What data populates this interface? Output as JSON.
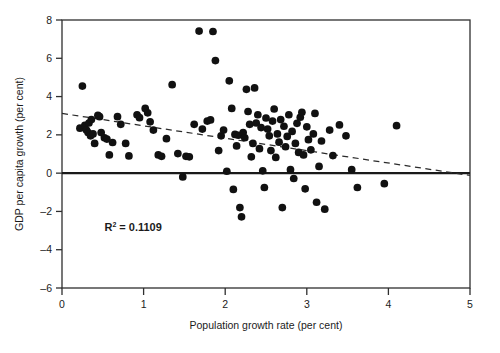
{
  "chart_data": {
    "type": "scatter",
    "title": "",
    "xlabel": "Population growth rate (per cent)",
    "ylabel": "GDP per capita growth (per cent)",
    "xlim": [
      0,
      5
    ],
    "ylim": [
      -6,
      8
    ],
    "xticks": [
      0,
      1,
      2,
      3,
      4,
      5
    ],
    "xtick_labels": [
      "0",
      "1",
      "2",
      "3",
      "4",
      "5"
    ],
    "yticks": [
      -6,
      -4,
      -2,
      0,
      2,
      4,
      6,
      8
    ],
    "ytick_labels": [
      "-6",
      "-4",
      "-2",
      "0",
      "2",
      "4",
      "6",
      "8"
    ],
    "grid": false,
    "legend": null,
    "marker_color": "#111111",
    "marker_size": 5.2,
    "zero_line": {
      "y": 0,
      "color": "#1a1a1a",
      "width": 2.2
    },
    "trendline": {
      "style": "dashed",
      "color": "#2b2b2b",
      "x_start": 0.0,
      "y_start": 3.12,
      "x_end": 5.0,
      "y_end": -0.12
    },
    "annotations": [
      {
        "name": "r-squared",
        "text_prefix": "R",
        "text_sup": "2",
        "text_rest": " = 0.1109",
        "x": 0.52,
        "y": -3.0
      }
    ],
    "points": [
      [
        0.22,
        2.35
      ],
      [
        0.25,
        4.55
      ],
      [
        0.28,
        2.5
      ],
      [
        0.3,
        2.25
      ],
      [
        0.32,
        2.12
      ],
      [
        0.33,
        2.62
      ],
      [
        0.35,
        1.95
      ],
      [
        0.36,
        2.8
      ],
      [
        0.38,
        2.05
      ],
      [
        0.4,
        1.55
      ],
      [
        0.44,
        3.02
      ],
      [
        0.46,
        2.95
      ],
      [
        0.48,
        2.12
      ],
      [
        0.52,
        1.85
      ],
      [
        0.55,
        1.78
      ],
      [
        0.58,
        0.95
      ],
      [
        0.62,
        1.6
      ],
      [
        0.68,
        2.95
      ],
      [
        0.72,
        2.55
      ],
      [
        0.78,
        1.55
      ],
      [
        0.82,
        0.9
      ],
      [
        0.92,
        3.05
      ],
      [
        0.95,
        2.9
      ],
      [
        1.02,
        3.38
      ],
      [
        1.05,
        3.15
      ],
      [
        1.08,
        2.68
      ],
      [
        1.12,
        2.25
      ],
      [
        1.18,
        0.95
      ],
      [
        1.22,
        0.88
      ],
      [
        1.28,
        1.8
      ],
      [
        1.35,
        4.62
      ],
      [
        1.42,
        1.02
      ],
      [
        1.48,
        -0.2
      ],
      [
        1.52,
        0.88
      ],
      [
        1.56,
        0.85
      ],
      [
        1.62,
        2.55
      ],
      [
        1.68,
        7.42
      ],
      [
        1.72,
        2.3
      ],
      [
        1.78,
        2.72
      ],
      [
        1.82,
        2.78
      ],
      [
        1.85,
        7.4
      ],
      [
        1.88,
        5.88
      ],
      [
        1.92,
        1.18
      ],
      [
        1.95,
        1.95
      ],
      [
        1.98,
        2.25
      ],
      [
        2.02,
        0.1
      ],
      [
        2.05,
        4.82
      ],
      [
        2.08,
        3.38
      ],
      [
        2.1,
        -0.85
      ],
      [
        2.12,
        2.02
      ],
      [
        2.14,
        1.42
      ],
      [
        2.16,
        1.98
      ],
      [
        2.18,
        -1.8
      ],
      [
        2.2,
        -2.28
      ],
      [
        2.22,
        2.12
      ],
      [
        2.24,
        1.85
      ],
      [
        2.26,
        4.38
      ],
      [
        2.28,
        3.22
      ],
      [
        2.3,
        2.55
      ],
      [
        2.32,
        0.85
      ],
      [
        2.34,
        1.55
      ],
      [
        2.36,
        4.45
      ],
      [
        2.38,
        2.62
      ],
      [
        2.4,
        3.05
      ],
      [
        2.42,
        1.28
      ],
      [
        2.44,
        2.38
      ],
      [
        2.46,
        0.12
      ],
      [
        2.48,
        -0.75
      ],
      [
        2.5,
        2.88
      ],
      [
        2.52,
        2.3
      ],
      [
        2.54,
        1.95
      ],
      [
        2.56,
        1.18
      ],
      [
        2.58,
        2.72
      ],
      [
        2.6,
        3.35
      ],
      [
        2.62,
        0.82
      ],
      [
        2.64,
        2.05
      ],
      [
        2.66,
        1.62
      ],
      [
        2.68,
        2.8
      ],
      [
        2.7,
        -1.8
      ],
      [
        2.72,
        2.45
      ],
      [
        2.74,
        1.38
      ],
      [
        2.76,
        1.92
      ],
      [
        2.78,
        3.05
      ],
      [
        2.8,
        0.18
      ],
      [
        2.82,
        2.18
      ],
      [
        2.84,
        -0.28
      ],
      [
        2.86,
        1.55
      ],
      [
        2.88,
        2.6
      ],
      [
        2.9,
        1.08
      ],
      [
        2.92,
        2.92
      ],
      [
        2.94,
        3.18
      ],
      [
        2.96,
        0.95
      ],
      [
        2.98,
        -0.82
      ],
      [
        3.0,
        2.42
      ],
      [
        3.02,
        1.75
      ],
      [
        3.05,
        1.22
      ],
      [
        3.08,
        2.05
      ],
      [
        3.1,
        3.12
      ],
      [
        3.12,
        -1.52
      ],
      [
        3.15,
        0.35
      ],
      [
        3.18,
        1.68
      ],
      [
        3.22,
        -1.88
      ],
      [
        3.28,
        2.25
      ],
      [
        3.32,
        0.92
      ],
      [
        3.4,
        2.52
      ],
      [
        3.48,
        1.95
      ],
      [
        3.55,
        0.18
      ],
      [
        3.62,
        -0.75
      ],
      [
        3.95,
        -0.55
      ],
      [
        4.1,
        2.48
      ]
    ]
  }
}
